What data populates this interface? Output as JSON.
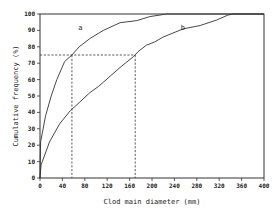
{
  "chart_data": {
    "type": "line",
    "title": "",
    "xlabel": "Clod main diameter (mm)",
    "ylabel": "Cumulative frequency (%)",
    "xlim": [
      0,
      400
    ],
    "ylim": [
      0,
      100
    ],
    "x_ticks": [
      0,
      40,
      80,
      120,
      160,
      200,
      240,
      280,
      320,
      360,
      400
    ],
    "y_ticks": [
      0,
      10,
      20,
      30,
      40,
      50,
      60,
      70,
      80,
      90,
      100
    ],
    "grid": false,
    "legend": "inline curve labels",
    "series": [
      {
        "name": "a",
        "points": [
          [
            0,
            0
          ],
          [
            1,
            22
          ],
          [
            10,
            38
          ],
          [
            20,
            50
          ],
          [
            30,
            60
          ],
          [
            44,
            71
          ],
          [
            57,
            75
          ],
          [
            70,
            80
          ],
          [
            89,
            85
          ],
          [
            113,
            90
          ],
          [
            143,
            94.7
          ],
          [
            173,
            96
          ],
          [
            196,
            98.4
          ],
          [
            226,
            100
          ],
          [
            400,
            100
          ]
        ]
      },
      {
        "name": "b",
        "points": [
          [
            0,
            0
          ],
          [
            2,
            8
          ],
          [
            17,
            22
          ],
          [
            35,
            33
          ],
          [
            54,
            41
          ],
          [
            70,
            46
          ],
          [
            89,
            52
          ],
          [
            105,
            56
          ],
          [
            125,
            62
          ],
          [
            145,
            68
          ],
          [
            167,
            74
          ],
          [
            175,
            77
          ],
          [
            190,
            81
          ],
          [
            205,
            83
          ],
          [
            220,
            86
          ],
          [
            256,
            91
          ],
          [
            286,
            93
          ],
          [
            315,
            96.3
          ],
          [
            336,
            99.4
          ],
          [
            345,
            100
          ],
          [
            400,
            100
          ]
        ]
      }
    ],
    "annotations": [
      {
        "type": "dashed-line",
        "description": "75% reference for curve a",
        "x": 57,
        "y": 75
      },
      {
        "type": "dashed-line",
        "description": "75% reference for curve b",
        "x": 170,
        "y": 75
      },
      {
        "type": "text",
        "text": "a",
        "x": 72,
        "y": 90
      },
      {
        "type": "text",
        "text": "b",
        "x": 255,
        "y": 90
      }
    ]
  },
  "labels": {
    "xlabel": "Clod main diameter (mm)",
    "ylabel": "Cumulative frequency (%)",
    "curve_a": "a",
    "curve_b": "b"
  }
}
